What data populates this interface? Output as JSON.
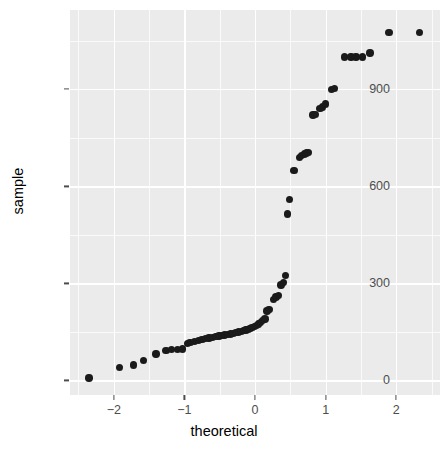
{
  "chart_data": {
    "type": "scatter",
    "title": "",
    "xlabel": "theoretical",
    "ylabel": "sample",
    "xlim": [
      -2.62,
      2.62
    ],
    "ylim": [
      -45,
      1145
    ],
    "grid": true,
    "legend": "none",
    "x_ticks": [
      -2,
      -1,
      0,
      1,
      2
    ],
    "x_tick_labels": [
      "−2",
      "−1",
      "0",
      "1",
      "2"
    ],
    "x_minor_ticks": [
      -2.5,
      -1.5,
      -0.5,
      0.5,
      1.5,
      2.5
    ],
    "y_ticks": [
      0,
      300,
      600,
      900
    ],
    "y_tick_labels": [
      "0",
      "300",
      "600",
      "900"
    ],
    "y_minor_ticks": [
      150,
      450,
      750,
      1050
    ],
    "point_color": "#1a1a1a",
    "panel_color": "#ebebeb",
    "grid_color": "#ffffff",
    "n_points": 64,
    "points": [
      {
        "x": -2.35,
        "y": 8
      },
      {
        "x": -1.92,
        "y": 40
      },
      {
        "x": -1.72,
        "y": 48
      },
      {
        "x": -1.58,
        "y": 62
      },
      {
        "x": -1.4,
        "y": 82
      },
      {
        "x": -1.26,
        "y": 93
      },
      {
        "x": -1.18,
        "y": 95
      },
      {
        "x": -1.1,
        "y": 96
      },
      {
        "x": -1.03,
        "y": 97
      },
      {
        "x": -0.96,
        "y": 115
      },
      {
        "x": -0.92,
        "y": 118
      },
      {
        "x": -0.86,
        "y": 121
      },
      {
        "x": -0.8,
        "y": 124
      },
      {
        "x": -0.75,
        "y": 126
      },
      {
        "x": -0.7,
        "y": 129
      },
      {
        "x": -0.65,
        "y": 131
      },
      {
        "x": -0.6,
        "y": 133
      },
      {
        "x": -0.55,
        "y": 135
      },
      {
        "x": -0.51,
        "y": 137
      },
      {
        "x": -0.47,
        "y": 139
      },
      {
        "x": -0.43,
        "y": 140
      },
      {
        "x": -0.39,
        "y": 142
      },
      {
        "x": -0.35,
        "y": 144
      },
      {
        "x": -0.31,
        "y": 146
      },
      {
        "x": -0.27,
        "y": 148
      },
      {
        "x": -0.23,
        "y": 150
      },
      {
        "x": -0.19,
        "y": 152
      },
      {
        "x": -0.16,
        "y": 154
      },
      {
        "x": -0.13,
        "y": 156
      },
      {
        "x": -0.1,
        "y": 158
      },
      {
        "x": -0.07,
        "y": 160
      },
      {
        "x": -0.04,
        "y": 163
      },
      {
        "x": -0.01,
        "y": 166
      },
      {
        "x": 0.02,
        "y": 170
      },
      {
        "x": 0.05,
        "y": 175
      },
      {
        "x": 0.08,
        "y": 180
      },
      {
        "x": 0.11,
        "y": 185
      },
      {
        "x": 0.14,
        "y": 190
      },
      {
        "x": 0.17,
        "y": 215
      },
      {
        "x": 0.2,
        "y": 220
      },
      {
        "x": 0.26,
        "y": 250
      },
      {
        "x": 0.3,
        "y": 258
      },
      {
        "x": 0.33,
        "y": 262
      },
      {
        "x": 0.37,
        "y": 295
      },
      {
        "x": 0.4,
        "y": 302
      },
      {
        "x": 0.43,
        "y": 325
      },
      {
        "x": 0.46,
        "y": 515
      },
      {
        "x": 0.49,
        "y": 560
      },
      {
        "x": 0.55,
        "y": 648
      },
      {
        "x": 0.63,
        "y": 690
      },
      {
        "x": 0.66,
        "y": 696
      },
      {
        "x": 0.7,
        "y": 700
      },
      {
        "x": 0.73,
        "y": 703
      },
      {
        "x": 0.76,
        "y": 705
      },
      {
        "x": 0.82,
        "y": 820
      },
      {
        "x": 0.85,
        "y": 822
      },
      {
        "x": 0.92,
        "y": 840
      },
      {
        "x": 0.96,
        "y": 845
      },
      {
        "x": 1.0,
        "y": 855
      },
      {
        "x": 1.08,
        "y": 900
      },
      {
        "x": 1.13,
        "y": 903
      },
      {
        "x": 1.27,
        "y": 1000
      },
      {
        "x": 1.36,
        "y": 1000
      },
      {
        "x": 1.43,
        "y": 1000
      },
      {
        "x": 1.52,
        "y": 1000
      },
      {
        "x": 1.63,
        "y": 1012
      },
      {
        "x": 1.9,
        "y": 1075
      },
      {
        "x": 2.33,
        "y": 1075
      }
    ]
  }
}
